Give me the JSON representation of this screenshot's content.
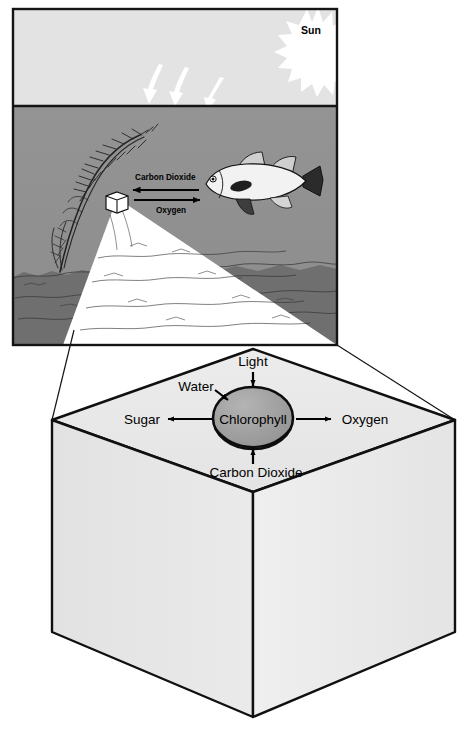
{
  "figure": {
    "colors": {
      "sky": "#e3e3e3",
      "water": "#919191",
      "sediment": "#6e6e6e",
      "frame": "#1a1a1a",
      "cube_top": "#e9e9e9",
      "cube_left": "#e6e6e6",
      "cube_right": "#ededed",
      "chlorophyll": "#9a9a9a",
      "fish_body": "#f2f2f2",
      "fish_fin": "#2a2a2a",
      "arrow_white": "#ffffff",
      "text": "#000000"
    }
  },
  "scene": {
    "sun_label": "Sun",
    "sunlight_arrows": 3,
    "exchange": {
      "carbon_dioxide_label": "Carbon Dioxide",
      "carbon_dioxide_direction": "left",
      "oxygen_label": "Oxygen",
      "oxygen_direction": "right"
    },
    "elements": [
      "sun-starburst",
      "sky-band",
      "water-band",
      "sediment-band",
      "aquatic-plant",
      "fish",
      "magnifier-cube"
    ]
  },
  "closeup": {
    "center_label": "Chlorophyll",
    "inputs": [
      {
        "key": "light",
        "label": "Light",
        "direction": "down",
        "position": "top"
      },
      {
        "key": "water",
        "label": "Water",
        "direction": "down-right",
        "position": "upper-left"
      },
      {
        "key": "carbon_dioxide",
        "label": "Carbon Dioxide",
        "direction": "up",
        "position": "bottom"
      }
    ],
    "outputs": [
      {
        "key": "sugar",
        "label": "Sugar",
        "direction": "left",
        "position": "left"
      },
      {
        "key": "oxygen",
        "label": "Oxygen",
        "direction": "right",
        "position": "right"
      }
    ]
  }
}
